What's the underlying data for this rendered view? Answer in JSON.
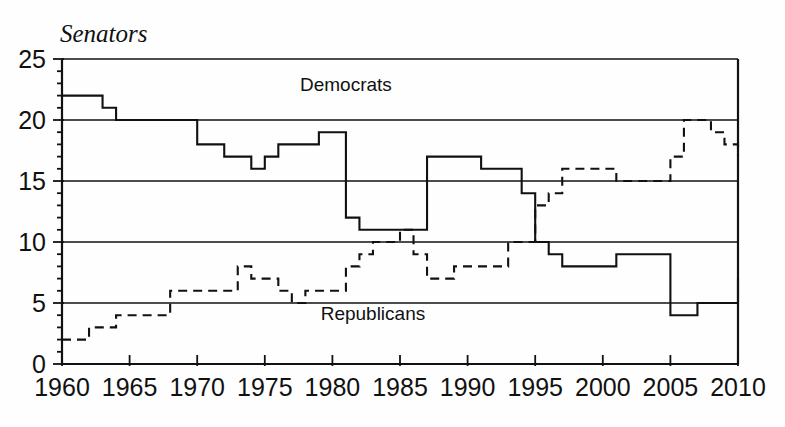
{
  "chart_data": {
    "type": "line",
    "title": "",
    "ylabel": "Senators",
    "xlabel": "",
    "xlim": [
      1960,
      2010
    ],
    "ylim": [
      0,
      25
    ],
    "grid": true,
    "grid_values": [
      5,
      10,
      15,
      20,
      25
    ],
    "legend_position": "inline-annotations",
    "y_ticks": [
      "0",
      "5",
      "10",
      "15",
      "20",
      "25"
    ],
    "y_tick_values": [
      0,
      5,
      10,
      15,
      20,
      25
    ],
    "x_ticks": [
      "1960",
      "1965",
      "1970",
      "1975",
      "1980",
      "1985",
      "1990",
      "1995",
      "2000",
      "2005",
      "2010"
    ],
    "x_tick_values": [
      1960,
      1965,
      1970,
      1975,
      1980,
      1985,
      1990,
      1995,
      2000,
      2005,
      2010
    ],
    "minor_x_tick_step": 1,
    "annotations": [
      {
        "text": "Democrats",
        "x": 1981,
        "y": 22.4
      },
      {
        "text": "Republicans",
        "x": 1983,
        "y": 3.6
      }
    ],
    "series": [
      {
        "name": "Democrats",
        "style": "solid",
        "color": "#111111",
        "x": [
          1960,
          1961,
          1962,
          1963,
          1964,
          1965,
          1966,
          1967,
          1968,
          1969,
          1970,
          1971,
          1972,
          1973,
          1974,
          1975,
          1976,
          1977,
          1978,
          1979,
          1980,
          1981,
          1982,
          1983,
          1984,
          1985,
          1986,
          1987,
          1988,
          1989,
          1990,
          1991,
          1992,
          1993,
          1994,
          1995,
          1996,
          1997,
          1998,
          1999,
          2000,
          2001,
          2002,
          2003,
          2004,
          2005,
          2006,
          2007,
          2008,
          2009,
          2010
        ],
        "values": [
          22,
          22,
          22,
          21,
          20,
          20,
          20,
          20,
          20,
          20,
          18,
          18,
          17,
          17,
          16,
          17,
          18,
          18,
          18,
          19,
          19,
          12,
          11,
          11,
          11,
          11,
          11,
          17,
          17,
          17,
          17,
          16,
          16,
          16,
          14,
          10,
          9,
          8,
          8,
          8,
          8,
          9,
          9,
          9,
          9,
          4,
          4,
          5,
          5,
          5,
          7
        ]
      },
      {
        "name": "Republicans",
        "style": "dashed",
        "color": "#111111",
        "x": [
          1960,
          1961,
          1962,
          1963,
          1964,
          1965,
          1966,
          1967,
          1968,
          1969,
          1970,
          1971,
          1972,
          1973,
          1974,
          1975,
          1976,
          1977,
          1978,
          1979,
          1980,
          1981,
          1982,
          1983,
          1984,
          1985,
          1986,
          1987,
          1988,
          1989,
          1990,
          1991,
          1992,
          1993,
          1994,
          1995,
          1996,
          1997,
          1998,
          1999,
          2000,
          2001,
          2002,
          2003,
          2004,
          2005,
          2006,
          2007,
          2008,
          2009,
          2010
        ],
        "values": [
          2,
          2,
          3,
          3,
          4,
          4,
          4,
          4,
          6,
          6,
          6,
          6,
          6,
          8,
          7,
          7,
          6,
          5,
          6,
          6,
          6,
          8,
          9,
          10,
          10,
          11,
          9,
          7,
          7,
          8,
          8,
          8,
          8,
          10,
          10,
          13,
          14,
          16,
          16,
          16,
          16,
          15,
          15,
          15,
          15,
          17,
          20,
          20,
          19,
          18,
          17
        ]
      }
    ]
  }
}
